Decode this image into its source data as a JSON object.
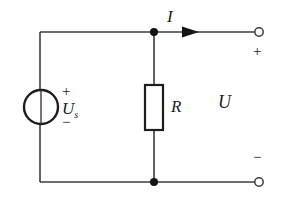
{
  "diagram": {
    "type": "electrical-circuit-schematic",
    "background_color": "#ffffff",
    "line_color": "#3c3c3c",
    "text_color": "#1d1d1d",
    "labels": {
      "current": "I",
      "resistor": "R",
      "output_voltage": "U",
      "source_symbol": "U",
      "source_subscript": "s",
      "source_plus": "+",
      "source_minus": "−",
      "terminal_plus": "+",
      "terminal_minus": "−"
    },
    "components": [
      {
        "name": "voltage-source",
        "symbol": "circle-with-vertical-line",
        "label": "Us",
        "polarity_top": "+",
        "polarity_bottom": "−",
        "center_x": 41,
        "center_y": 107,
        "radius": 17
      },
      {
        "name": "resistor",
        "symbol": "rectangle",
        "label": "R",
        "x": 145,
        "y": 85,
        "width": 18,
        "height": 45
      },
      {
        "name": "top-output-terminal",
        "symbol": "open-circle",
        "polarity": "+",
        "center_x": 259,
        "center_y": 32,
        "radius": 4
      },
      {
        "name": "bottom-output-terminal",
        "symbol": "open-circle",
        "polarity": "−",
        "center_x": 259,
        "center_y": 182,
        "radius": 4
      },
      {
        "name": "top-junction-node",
        "symbol": "filled-dot",
        "center_x": 154,
        "center_y": 32,
        "radius": 4
      },
      {
        "name": "bottom-junction-node",
        "symbol": "filled-dot",
        "center_x": 154,
        "center_y": 182,
        "radius": 4
      },
      {
        "name": "current-arrow",
        "symbol": "solid-triangle-right",
        "label": "I",
        "tip_x": 199,
        "y": 32
      }
    ],
    "wires": [
      {
        "name": "left-branch-top",
        "x1": 40,
        "y1": 32,
        "x2": 40,
        "y2": 90
      },
      {
        "name": "left-branch-bottom",
        "x1": 40,
        "y1": 124,
        "x2": 40,
        "y2": 182
      },
      {
        "name": "top-wire",
        "x1": 40,
        "y1": 32,
        "x2": 255,
        "y2": 32
      },
      {
        "name": "bottom-wire",
        "x1": 40,
        "y1": 182,
        "x2": 255,
        "y2": 182
      },
      {
        "name": "resistor-lead-top",
        "x1": 154,
        "y1": 32,
        "x2": 154,
        "y2": 85
      },
      {
        "name": "resistor-lead-bottom",
        "x1": 154,
        "y1": 130,
        "x2": 154,
        "y2": 182
      },
      {
        "name": "source-internal-line",
        "x1": 40,
        "y1": 90,
        "x2": 40,
        "y2": 124
      }
    ]
  }
}
